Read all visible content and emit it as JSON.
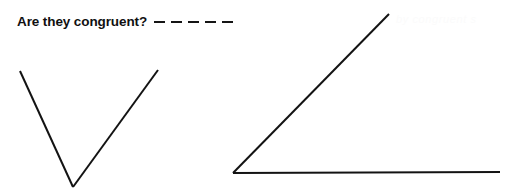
{
  "page": {
    "background_color": "#ffffff",
    "ink_color": "#131313",
    "width": 512,
    "height": 195
  },
  "prompt": {
    "question_text": "Are they congruent?",
    "answer_blank": {
      "dash_count": 5,
      "dash_label": "answer-blank-dash"
    }
  },
  "artifact": {
    "ghost_text": "by congruent s"
  },
  "figures": [
    {
      "name": "left-angle-v-shape",
      "description": "Acute V-shaped angle opening upward",
      "vertex": {
        "x": 73,
        "y": 187
      },
      "rays": [
        {
          "name": "left-ray",
          "from": {
            "x": 73,
            "y": 187
          },
          "to": {
            "x": 20,
            "y": 71
          }
        },
        {
          "name": "right-ray",
          "from": {
            "x": 73,
            "y": 187
          },
          "to": {
            "x": 158,
            "y": 70
          }
        }
      ]
    },
    {
      "name": "right-angle-wide-shape",
      "description": "Acute angle with horizontal base ray and rising diagonal ray",
      "vertex": {
        "x": 233,
        "y": 173
      },
      "rays": [
        {
          "name": "horizontal-ray",
          "from": {
            "x": 233,
            "y": 173
          },
          "to": {
            "x": 500,
            "y": 172
          }
        },
        {
          "name": "diagonal-ray",
          "from": {
            "x": 233,
            "y": 173
          },
          "to": {
            "x": 389,
            "y": 14
          }
        }
      ]
    }
  ]
}
